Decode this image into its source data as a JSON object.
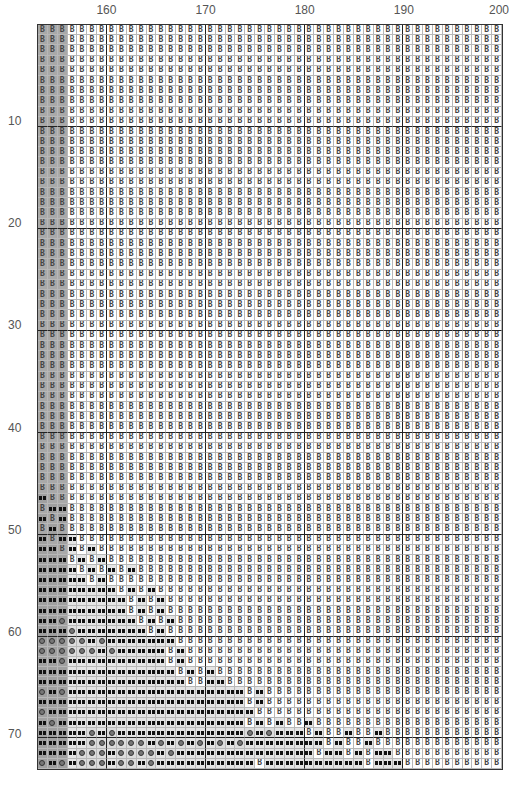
{
  "chart": {
    "columns": 47,
    "rows": 73,
    "first_column": 154,
    "shaded_columns": 3,
    "column_labels": [
      {
        "label": "160",
        "after_col": 7
      },
      {
        "label": "170",
        "after_col": 17
      },
      {
        "label": "180",
        "after_col": 27
      },
      {
        "label": "190",
        "after_col": 37
      },
      {
        "label": "200",
        "after_col": 47
      }
    ],
    "row_labels": [
      {
        "label": "10",
        "row": 10
      },
      {
        "label": "20",
        "row": 20
      },
      {
        "label": "30",
        "row": 30
      },
      {
        "label": "40",
        "row": 40
      },
      {
        "label": "50",
        "row": 50
      },
      {
        "label": "60",
        "row": 60
      },
      {
        "label": "70",
        "row": 70
      }
    ],
    "symbols": {
      "B": "b-glyph",
      "x": "bowtie-glyph",
      "o": "circle-glyph"
    },
    "colors": {
      "shaded_column_bg": "#a9a9a9",
      "cell_bg": "#ffffff",
      "bowtie_cell_bg": "#e4e4e4",
      "grid_line": "#b8b8b8",
      "major_grid_line": "#222222",
      "label_color": "#555555"
    },
    "default_row": "B",
    "pattern_rows": {
      "47": "xBB",
      "48": "Bxx",
      "49": "xBx",
      "50": "BxB",
      "51": "xBxxBB",
      "52": "xxBxBxB",
      "53": "xxxBxBxB",
      "54": "xxxxBxBxBxB",
      "55": "xxxxxBxB",
      "56": "xxxxxxxxBxBxB",
      "57": "xxxxxxxxxBxBxB",
      "58": "xxxxxxxxxBxBxB",
      "59": "xxoxxxxxxxBxBxB",
      "60": "xxxoxxxxxxxBxB",
      "61": "oooooxoxxxxxxxB",
      "62": "ooooooxoxxxxxBxB",
      "63": "xxoxxxxxxxxxxBxB",
      "64": "xxxxxxxxxxxxxxBxBxB",
      "65": "xxxxxxxxxxxxxxxBBxxB",
      "66": "oxoxxxxxxxxxxxxxxxxxxBxBBBB",
      "67": "xxxxxxxxxxxxxxxxxxxxxBxBBBB",
      "68": "oxxxxxxxxxxxxxxxxxxxxxBBBBB",
      "69": "xoxxxxxxxxxxxxxxxxxxxBxBxBBxBBB",
      "70": "xxxxxoxoxxxxxxxxxxxxxoxoxxxBxBBxBBxB",
      "71": "xxxxxooooooxoxoxoxoxoxxxxxxxxBxBBxBB",
      "72": "xxxxoooxooooxoxxxxxxxxxxxxxxBxxBxBxxB",
      "73": "oxoxoooxooxoxxxxxxxxxxBxxxxxxxxxxBxxxBBB"
    }
  }
}
